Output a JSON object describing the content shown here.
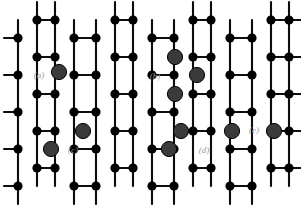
{
  "figure": {
    "width": 301,
    "height": 206,
    "background_color": "#ffffff",
    "carbon_color": "#000000",
    "dopant_color": "#3a3a3a",
    "bond_color": "#0d0d0d",
    "label_color": "#9a9a9a",
    "carbon_radius": 4.6,
    "dopant_radius": 7.6,
    "bond_width": 2.1
  },
  "chart_data": {
    "type": "scatter",
    "xlabel": "",
    "ylabel": "",
    "xlim": [
      0,
      301
    ],
    "ylim": [
      0,
      206
    ],
    "grid": false,
    "legend_position": "none",
    "lattice": {
      "geometry": "honeycomb",
      "orientation": "armchair-horizontal",
      "column_x": [
        18,
        37,
        55,
        74,
        96,
        115,
        133,
        152,
        174,
        193,
        211,
        230,
        252,
        271,
        289
      ],
      "row_y": [
        20,
        38,
        57,
        75,
        94,
        112,
        131,
        149,
        168,
        186
      ],
      "note": "Vertical zig-zag chains joined by horizontal bonds forming hexagonal rings"
    },
    "series": [
      {
        "name": "Carbon atoms",
        "color": "#000000",
        "marker": "circle",
        "size": 9.2,
        "points": [
          [
            18,
            38
          ],
          [
            18,
            75
          ],
          [
            18,
            112
          ],
          [
            18,
            149
          ],
          [
            18,
            186
          ],
          [
            37,
            20
          ],
          [
            37,
            57
          ],
          [
            37,
            94
          ],
          [
            37,
            131
          ],
          [
            37,
            168
          ],
          [
            55,
            20
          ],
          [
            55,
            57
          ],
          [
            55,
            94
          ],
          [
            55,
            131
          ],
          [
            55,
            168
          ],
          [
            74,
            38
          ],
          [
            74,
            75
          ],
          [
            74,
            112
          ],
          [
            74,
            149
          ],
          [
            74,
            186
          ],
          [
            96,
            38
          ],
          [
            96,
            75
          ],
          [
            96,
            112
          ],
          [
            96,
            149
          ],
          [
            96,
            186
          ],
          [
            115,
            20
          ],
          [
            115,
            57
          ],
          [
            115,
            94
          ],
          [
            115,
            131
          ],
          [
            115,
            168
          ],
          [
            133,
            20
          ],
          [
            133,
            57
          ],
          [
            133,
            94
          ],
          [
            133,
            131
          ],
          [
            133,
            168
          ],
          [
            152,
            38
          ],
          [
            152,
            75
          ],
          [
            152,
            112
          ],
          [
            152,
            149
          ],
          [
            152,
            186
          ],
          [
            174,
            38
          ],
          [
            174,
            75
          ],
          [
            174,
            112
          ],
          [
            174,
            149
          ],
          [
            174,
            186
          ],
          [
            193,
            20
          ],
          [
            193,
            57
          ],
          [
            193,
            94
          ],
          [
            193,
            131
          ],
          [
            193,
            168
          ],
          [
            211,
            20
          ],
          [
            211,
            57
          ],
          [
            211,
            94
          ],
          [
            211,
            131
          ],
          [
            211,
            168
          ],
          [
            230,
            38
          ],
          [
            230,
            75
          ],
          [
            230,
            112
          ],
          [
            230,
            149
          ],
          [
            230,
            186
          ],
          [
            252,
            38
          ],
          [
            252,
            75
          ],
          [
            252,
            112
          ],
          [
            252,
            149
          ],
          [
            252,
            186
          ],
          [
            271,
            20
          ],
          [
            271,
            57
          ],
          [
            271,
            94
          ],
          [
            271,
            131
          ],
          [
            271,
            168
          ],
          [
            289,
            20
          ],
          [
            289,
            57
          ],
          [
            289,
            94
          ],
          [
            289,
            131
          ],
          [
            289,
            168
          ]
        ]
      },
      {
        "name": "Dopant atoms",
        "color": "#3a3a3a",
        "marker": "circle",
        "size": 15.2,
        "points": [
          [
            59,
            72
          ],
          [
            175,
            57
          ],
          [
            175,
            94
          ],
          [
            197,
            75
          ],
          [
            51,
            149
          ],
          [
            83,
            131
          ],
          [
            169,
            149
          ],
          [
            181,
            131
          ],
          [
            232,
            131
          ],
          [
            274,
            131
          ]
        ]
      }
    ],
    "annotations": [
      {
        "text": "(a)",
        "x": 39,
        "y": 75
      },
      {
        "text": "(b)",
        "x": 155,
        "y": 76
      },
      {
        "text": "(c)",
        "x": 73,
        "y": 150
      },
      {
        "text": "(d)",
        "x": 204,
        "y": 150
      },
      {
        "text": "(e)",
        "x": 254,
        "y": 130
      }
    ]
  }
}
